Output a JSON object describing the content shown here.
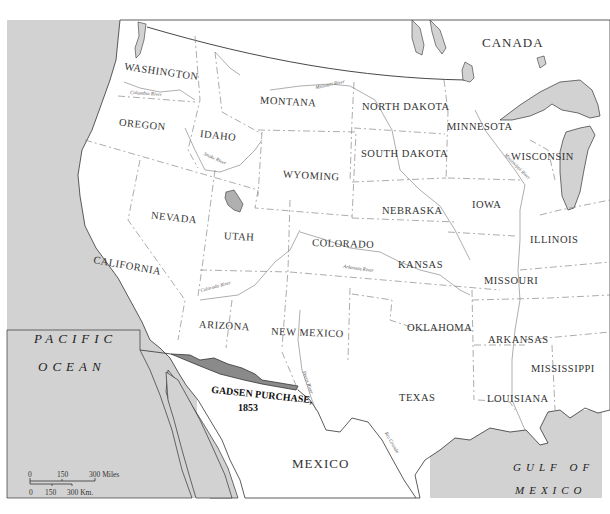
{
  "map": {
    "title": "Gadsen Purchase, 1853",
    "colors": {
      "water": "#d2d2d2",
      "land": "#ffffff",
      "gadsen_purchase": "#8a8a8a",
      "boundary": "#888888",
      "coast": "#333333",
      "text": "#333333"
    },
    "countries": [
      {
        "name": "CANADA"
      },
      {
        "name": "MEXICO"
      }
    ],
    "water_bodies": [
      {
        "line1": "PACIFIC",
        "line2": "OCEAN"
      },
      {
        "line1": "GULF OF",
        "line2": "MEXICO"
      }
    ],
    "states": [
      {
        "name": "WASHINGTON"
      },
      {
        "name": "OREGON"
      },
      {
        "name": "CALIFORNIA"
      },
      {
        "name": "IDAHO"
      },
      {
        "name": "NEVADA"
      },
      {
        "name": "MONTANA"
      },
      {
        "name": "WYOMING"
      },
      {
        "name": "UTAH"
      },
      {
        "name": "ARIZONA"
      },
      {
        "name": "COLORADO"
      },
      {
        "name": "NEW MEXICO"
      },
      {
        "name": "NORTH DAKOTA"
      },
      {
        "name": "SOUTH DAKOTA"
      },
      {
        "name": "NEBRASKA"
      },
      {
        "name": "KANSAS"
      },
      {
        "name": "OKLAHOMA"
      },
      {
        "name": "TEXAS"
      },
      {
        "name": "MINNESOTA"
      },
      {
        "name": "IOWA"
      },
      {
        "name": "MISSOURI"
      },
      {
        "name": "ARKANSAS"
      },
      {
        "name": "LOUISIANA"
      },
      {
        "name": "WISCONSIN"
      },
      {
        "name": "ILLINOIS"
      },
      {
        "name": "MISSISSIPPI"
      }
    ],
    "rivers": [
      {
        "name": "Columbia River"
      },
      {
        "name": "Snake River"
      },
      {
        "name": "Missouri River"
      },
      {
        "name": "Mississippi River"
      },
      {
        "name": "Colorado River"
      },
      {
        "name": "Arkansas River"
      },
      {
        "name": "Pecos River"
      },
      {
        "name": "Rio Grande"
      }
    ],
    "annotation": {
      "line1": "GADSEN PURCHASE,",
      "line2": "1853"
    },
    "scale_bar": {
      "miles": [
        "0",
        "150",
        "300 Miles"
      ],
      "km": [
        "0",
        "150",
        "300 Km."
      ]
    }
  }
}
